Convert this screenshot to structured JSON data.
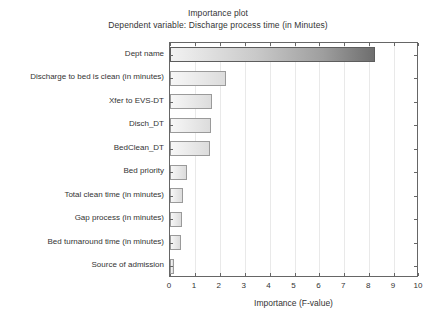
{
  "chart_data": {
    "type": "bar",
    "orientation": "horizontal",
    "title": "Importance plot",
    "subtitle": "Dependent variable: Discharge process time (in Minutes)",
    "xlabel": "Importance (F-value)",
    "ylabel": "",
    "xlim": [
      0,
      10
    ],
    "xticks": [
      "0",
      "1",
      "2",
      "3",
      "4",
      "5",
      "6",
      "7",
      "8",
      "9",
      "10"
    ],
    "grid": "vertical-only",
    "legend": "none",
    "categories": [
      "Dept name",
      "Discharge to bed is clean (in minutes)",
      "Xfer to EVS-DT",
      "Disch_DT",
      "BedClean_DT",
      "Bed priority",
      "Total clean time (in minutes)",
      "Gap process (in minutes)",
      "Bed turnaround time (in minutes)",
      "Source of admission"
    ],
    "values": [
      8.25,
      2.25,
      1.69,
      1.65,
      1.61,
      0.68,
      0.52,
      0.47,
      0.45,
      0.15
    ],
    "bar_colors": {
      "gradient_light": "#f2f2f2",
      "gradient_dark": "#6e6e6e",
      "default_fill_light": "#f7f7f7",
      "default_fill_dark": "#dcdcdc",
      "border": "#9a9a9a"
    },
    "axis_color": "#666666",
    "grid_color": "#e9e9e9"
  }
}
